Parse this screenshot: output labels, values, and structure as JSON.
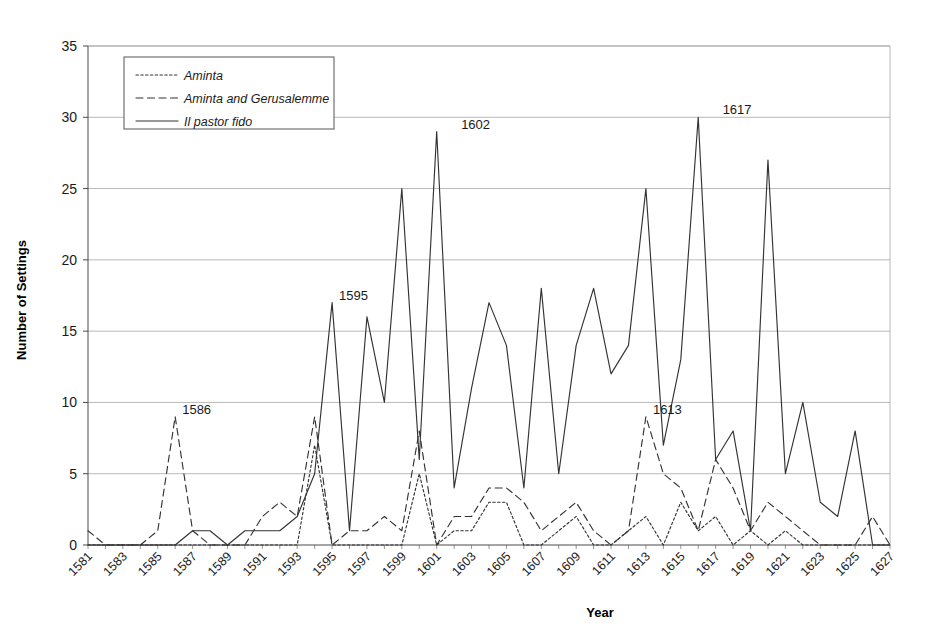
{
  "chart_data": {
    "type": "line",
    "title": "",
    "xlabel": "Year",
    "ylabel": "Number of Settings",
    "xlim": [
      1581,
      1627
    ],
    "ylim": [
      0,
      35
    ],
    "yticks": [
      0,
      5,
      10,
      15,
      20,
      25,
      30,
      35
    ],
    "xticks": [
      1581,
      1583,
      1585,
      1587,
      1589,
      1591,
      1593,
      1595,
      1597,
      1599,
      1601,
      1603,
      1605,
      1607,
      1609,
      1611,
      1613,
      1615,
      1617,
      1619,
      1621,
      1623,
      1625,
      1627
    ],
    "grid": "horizontal",
    "legend_position": "top-left",
    "x": [
      1581,
      1582,
      1583,
      1584,
      1585,
      1586,
      1587,
      1588,
      1589,
      1590,
      1591,
      1592,
      1593,
      1594,
      1595,
      1596,
      1597,
      1598,
      1599,
      1600,
      1601,
      1602,
      1603,
      1604,
      1605,
      1606,
      1607,
      1608,
      1609,
      1610,
      1611,
      1612,
      1613,
      1614,
      1615,
      1616,
      1617,
      1618,
      1619,
      1620,
      1621,
      1622,
      1623,
      1624,
      1625,
      1626,
      1627
    ],
    "series": [
      {
        "name": "Aminta",
        "style": "dotted",
        "values": [
          0,
          0,
          0,
          0,
          0,
          0,
          0,
          0,
          0,
          0,
          0,
          0,
          0,
          7,
          0,
          0,
          0,
          0,
          0,
          5,
          0,
          1,
          1,
          3,
          3,
          0,
          0,
          1,
          2,
          0,
          0,
          1,
          2,
          0,
          3,
          1,
          2,
          0,
          1,
          0,
          1,
          0,
          0,
          0,
          0,
          0,
          0
        ]
      },
      {
        "name": "Aminta and Gerusalemme",
        "style": "dashed",
        "values": [
          1,
          0,
          0,
          0,
          1,
          9,
          1,
          0,
          0,
          0,
          2,
          3,
          2,
          9,
          0,
          1,
          1,
          2,
          1,
          8,
          0,
          2,
          2,
          4,
          4,
          3,
          1,
          2,
          3,
          1,
          0,
          1,
          9,
          5,
          4,
          1,
          6,
          4,
          1,
          3,
          2,
          1,
          0,
          0,
          0,
          2,
          0
        ]
      },
      {
        "name": "Il pastor fido",
        "style": "solid",
        "values": [
          0,
          0,
          0,
          0,
          0,
          0,
          1,
          1,
          0,
          1,
          1,
          1,
          2,
          5,
          17,
          1,
          16,
          10,
          25,
          6,
          29,
          4,
          11,
          17,
          14,
          4,
          18,
          5,
          14,
          18,
          12,
          14,
          25,
          7,
          13,
          30,
          6,
          8,
          1,
          27,
          5,
          10,
          3,
          2,
          8,
          0,
          0
        ]
      }
    ],
    "annotations": [
      {
        "label": "1586",
        "x": 1586,
        "y": 9
      },
      {
        "label": "1595",
        "x": 1595,
        "y": 17
      },
      {
        "label": "1602",
        "x": 1602,
        "y": 29
      },
      {
        "label": "1613",
        "x": 1613,
        "y": 9
      },
      {
        "label": "1617",
        "x": 1617,
        "y": 30
      }
    ]
  },
  "legend": {
    "items": [
      {
        "label": "Aminta"
      },
      {
        "label": "Aminta and Gerusalemme"
      },
      {
        "label": "Il pastor fido"
      }
    ]
  },
  "colors": {
    "line": "#333333",
    "grid": "#9a9a9a",
    "axis": "#4a4a4a",
    "background": "#ffffff"
  }
}
